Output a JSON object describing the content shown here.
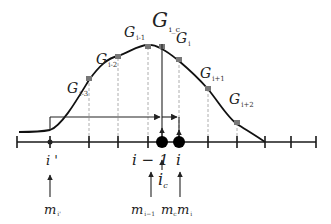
{
  "diagram": {
    "curve_points_labels": [
      {
        "base": "G",
        "sub": "i-3"
      },
      {
        "base": "G",
        "sub": "i-2"
      },
      {
        "base": "G",
        "sub": "i-1"
      },
      {
        "base": "G",
        "sub": "i_c"
      },
      {
        "base": "G",
        "sub": "i"
      },
      {
        "base": "G",
        "sub": "i+1"
      },
      {
        "base": "G",
        "sub": "i+2"
      }
    ],
    "axis_labels": {
      "i_prime": "i '",
      "i_minus_1": "i − 1",
      "i": "i",
      "i_c_base": "i",
      "i_c_sub": "c"
    },
    "bottom_labels": {
      "m_i_prime_base": "m",
      "m_i_prime_sub": "i'",
      "m_i_minus_1_base": "m",
      "m_i_minus_1_sub": "i−1",
      "m_c_base": "m",
      "m_c_sub": "c",
      "m_i_base": "m",
      "m_i_sub": "i"
    }
  }
}
